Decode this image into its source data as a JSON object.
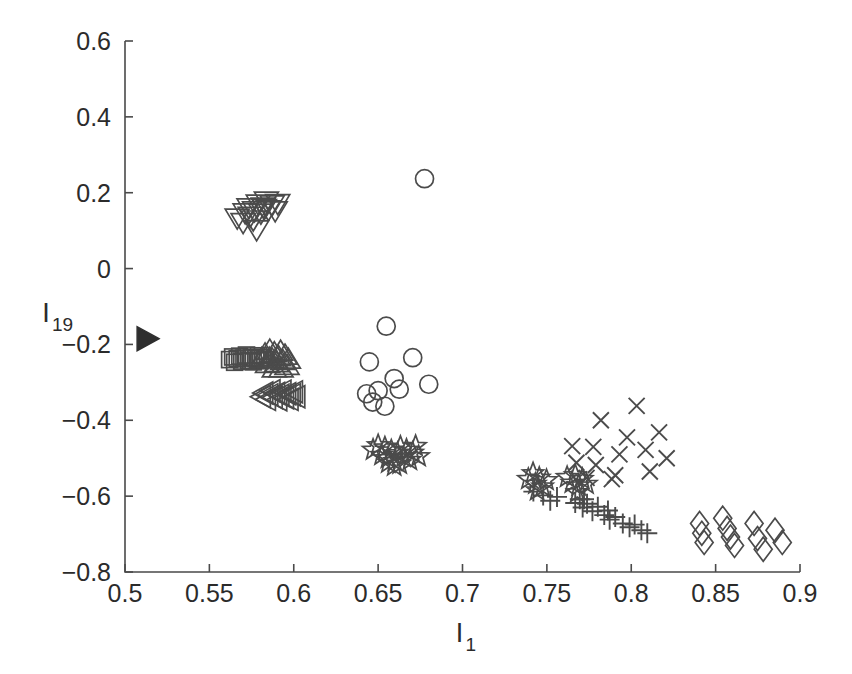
{
  "figure": {
    "background_color": "#ffffff",
    "foreground_color": "#4a4a4a",
    "marker_color": "#4b4b4b",
    "filled_marker_color": "#2e2e2e"
  },
  "axes": {
    "x_title": "I",
    "x_title_sub": "1",
    "y_title": "I",
    "y_title_sub": "19",
    "x_ticks": [
      "0.5",
      "0.55",
      "0.6",
      "0.65",
      "0.7",
      "0.75",
      "0.8",
      "0.85",
      "0.9"
    ],
    "x_tick_values": [
      0.5,
      0.55,
      0.6,
      0.65,
      0.7,
      0.75,
      0.8,
      0.85,
      0.9
    ],
    "y_ticks": [
      "0.6",
      "0.4",
      "0.2",
      "0",
      "-0.2",
      "-0.4",
      "-0.6",
      "-0.8"
    ],
    "y_tick_values": [
      0.6,
      0.4,
      0.2,
      0,
      -0.2,
      -0.4,
      -0.6,
      -0.8
    ]
  },
  "chart_data": {
    "type": "scatter",
    "title": "",
    "xlabel": "I_1",
    "ylabel": "I_19",
    "xlim": [
      0.5,
      0.9
    ],
    "ylim": [
      -0.8,
      0.6
    ],
    "grid": false,
    "legend": "none",
    "series": [
      {
        "name": "right-triangle-filled",
        "marker": "triangle-right",
        "filled": true,
        "points": [
          [
            0.5125,
            -0.185
          ]
        ]
      },
      {
        "name": "down-triangle",
        "marker": "triangle-down",
        "filled": false,
        "points": [
          [
            0.5665,
            0.133
          ],
          [
            0.57,
            0.121
          ],
          [
            0.5712,
            0.147
          ],
          [
            0.5735,
            0.16
          ],
          [
            0.5742,
            0.138
          ],
          [
            0.5768,
            0.152
          ],
          [
            0.579,
            0.17
          ],
          [
            0.5805,
            0.146
          ],
          [
            0.582,
            0.162
          ],
          [
            0.5838,
            0.178
          ],
          [
            0.585,
            0.155
          ],
          [
            0.5872,
            0.168
          ],
          [
            0.589,
            0.152
          ],
          [
            0.5905,
            0.171
          ],
          [
            0.578,
            0.102
          ],
          [
            0.5826,
            0.158
          ],
          [
            0.576,
            0.128
          ]
        ]
      },
      {
        "name": "square",
        "marker": "square",
        "filled": false,
        "points": [
          [
            0.562,
            -0.24
          ],
          [
            0.5638,
            -0.233
          ],
          [
            0.565,
            -0.247
          ],
          [
            0.5665,
            -0.238
          ],
          [
            0.568,
            -0.231
          ],
          [
            0.5692,
            -0.244
          ],
          [
            0.5705,
            -0.236
          ],
          [
            0.572,
            -0.228
          ],
          [
            0.5733,
            -0.242
          ],
          [
            0.5748,
            -0.234
          ],
          [
            0.576,
            -0.246
          ],
          [
            0.5775,
            -0.237
          ],
          [
            0.579,
            -0.23
          ],
          [
            0.5802,
            -0.243
          ],
          [
            0.5815,
            -0.235
          ],
          [
            0.5828,
            -0.24
          ]
        ]
      },
      {
        "name": "up-triangle",
        "marker": "triangle-up",
        "filled": false,
        "points": [
          [
            0.581,
            -0.237
          ],
          [
            0.583,
            -0.225
          ],
          [
            0.5845,
            -0.25
          ],
          [
            0.5858,
            -0.215
          ],
          [
            0.5872,
            -0.238
          ],
          [
            0.5885,
            -0.222
          ],
          [
            0.5898,
            -0.248
          ],
          [
            0.591,
            -0.232
          ],
          [
            0.5922,
            -0.218
          ],
          [
            0.5935,
            -0.242
          ],
          [
            0.5948,
            -0.228
          ],
          [
            0.596,
            -0.255
          ],
          [
            0.5925,
            -0.262
          ],
          [
            0.5885,
            -0.262
          ],
          [
            0.5855,
            -0.236
          ],
          [
            0.5968,
            -0.239
          ]
        ]
      },
      {
        "name": "left-triangle",
        "marker": "triangle-left",
        "filled": false,
        "points": [
          [
            0.5808,
            -0.338
          ],
          [
            0.5822,
            -0.328
          ],
          [
            0.5838,
            -0.345
          ],
          [
            0.5852,
            -0.333
          ],
          [
            0.5865,
            -0.322
          ],
          [
            0.5878,
            -0.34
          ],
          [
            0.5892,
            -0.329
          ],
          [
            0.5905,
            -0.346
          ],
          [
            0.5918,
            -0.334
          ],
          [
            0.593,
            -0.323
          ],
          [
            0.5945,
            -0.341
          ],
          [
            0.5958,
            -0.33
          ],
          [
            0.5972,
            -0.345
          ],
          [
            0.5985,
            -0.333
          ],
          [
            0.5998,
            -0.325
          ],
          [
            0.6012,
            -0.338
          ]
        ]
      },
      {
        "name": "circle",
        "marker": "circle",
        "filled": false,
        "points": [
          [
            0.6775,
            0.237
          ],
          [
            0.6548,
            -0.152
          ],
          [
            0.6448,
            -0.246
          ],
          [
            0.65,
            -0.322
          ],
          [
            0.6432,
            -0.33
          ],
          [
            0.6468,
            -0.352
          ],
          [
            0.6595,
            -0.29
          ],
          [
            0.6705,
            -0.235
          ],
          [
            0.6625,
            -0.318
          ],
          [
            0.654,
            -0.363
          ],
          [
            0.68,
            -0.305
          ]
        ]
      },
      {
        "name": "pentagram-cluster-1",
        "marker": "pentagram",
        "filled": false,
        "points": [
          [
            0.647,
            -0.478
          ],
          [
            0.65,
            -0.466
          ],
          [
            0.652,
            -0.492
          ],
          [
            0.654,
            -0.472
          ],
          [
            0.6558,
            -0.5
          ],
          [
            0.6578,
            -0.48
          ],
          [
            0.6598,
            -0.508
          ],
          [
            0.6615,
            -0.487
          ],
          [
            0.6632,
            -0.47
          ],
          [
            0.665,
            -0.497
          ],
          [
            0.6668,
            -0.478
          ],
          [
            0.6688,
            -0.505
          ],
          [
            0.6705,
            -0.486
          ],
          [
            0.6722,
            -0.468
          ],
          [
            0.674,
            -0.495
          ],
          [
            0.6595,
            -0.52
          ],
          [
            0.6628,
            -0.515
          ],
          [
            0.656,
            -0.512
          ]
        ]
      },
      {
        "name": "pentagram-cluster-2",
        "marker": "pentagram",
        "filled": false,
        "points": [
          [
            0.739,
            -0.555
          ],
          [
            0.7418,
            -0.54
          ],
          [
            0.7432,
            -0.568
          ],
          [
            0.7455,
            -0.552
          ],
          [
            0.7475,
            -0.575
          ],
          [
            0.7498,
            -0.558
          ],
          [
            0.762,
            -0.55
          ],
          [
            0.7648,
            -0.565
          ],
          [
            0.7668,
            -0.545
          ],
          [
            0.7688,
            -0.572
          ],
          [
            0.771,
            -0.555
          ],
          [
            0.7735,
            -0.568
          ],
          [
            0.7442,
            -0.585
          ],
          [
            0.768,
            -0.59
          ]
        ]
      },
      {
        "name": "plus",
        "marker": "plus",
        "filled": false,
        "points": [
          [
            0.742,
            -0.588
          ],
          [
            0.7478,
            -0.598
          ],
          [
            0.752,
            -0.612
          ],
          [
            0.756,
            -0.602
          ],
          [
            0.7668,
            -0.618
          ],
          [
            0.7695,
            -0.608
          ],
          [
            0.7712,
            -0.63
          ],
          [
            0.7738,
            -0.62
          ],
          [
            0.777,
            -0.64
          ],
          [
            0.7802,
            -0.628
          ],
          [
            0.784,
            -0.65
          ],
          [
            0.7872,
            -0.662
          ],
          [
            0.7905,
            -0.655
          ],
          [
            0.795,
            -0.672
          ],
          [
            0.799,
            -0.682
          ],
          [
            0.802,
            -0.675
          ],
          [
            0.806,
            -0.69
          ],
          [
            0.8095,
            -0.698
          ],
          [
            0.7862,
            -0.638
          ],
          [
            0.772,
            -0.608
          ]
        ]
      },
      {
        "name": "x-mark",
        "marker": "x",
        "filled": false,
        "points": [
          [
            0.765,
            -0.468
          ],
          [
            0.7675,
            -0.512
          ],
          [
            0.7775,
            -0.47
          ],
          [
            0.779,
            -0.518
          ],
          [
            0.782,
            -0.4
          ],
          [
            0.7885,
            -0.555
          ],
          [
            0.793,
            -0.49
          ],
          [
            0.7975,
            -0.445
          ],
          [
            0.8032,
            -0.362
          ],
          [
            0.8085,
            -0.478
          ],
          [
            0.811,
            -0.535
          ],
          [
            0.8165,
            -0.432
          ],
          [
            0.821,
            -0.5
          ],
          [
            0.7735,
            -0.552
          ],
          [
            0.7905,
            -0.545
          ]
        ]
      },
      {
        "name": "diamond",
        "marker": "diamond",
        "filled": false,
        "points": [
          [
            0.8405,
            -0.672
          ],
          [
            0.8418,
            -0.698
          ],
          [
            0.8432,
            -0.722
          ],
          [
            0.8542,
            -0.658
          ],
          [
            0.8568,
            -0.685
          ],
          [
            0.8588,
            -0.708
          ],
          [
            0.8612,
            -0.73
          ],
          [
            0.8728,
            -0.672
          ],
          [
            0.8748,
            -0.712
          ],
          [
            0.8782,
            -0.74
          ],
          [
            0.8852,
            -0.69
          ],
          [
            0.8895,
            -0.722
          ]
        ]
      }
    ]
  }
}
